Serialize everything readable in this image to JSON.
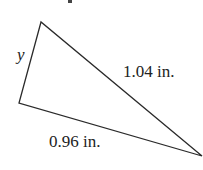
{
  "diagram": {
    "type": "triangle",
    "vertices": {
      "top": [
        41,
        22
      ],
      "left": [
        19,
        103
      ],
      "right": [
        202,
        156
      ]
    },
    "labels": {
      "side_left": "y",
      "side_right": "1.04 in.",
      "side_bottom": "0.96 in."
    },
    "stroke_color": "#2a2a2a"
  }
}
